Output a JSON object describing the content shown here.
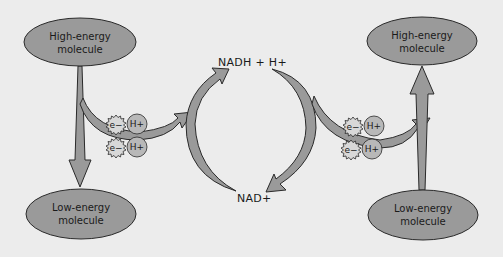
{
  "diagram": {
    "left": {
      "top_molecule": {
        "line1": "High-energy",
        "line2": "molecule"
      },
      "bottom_molecule": {
        "line1": "Low-energy",
        "line2": "molecule"
      },
      "particles": {
        "electron1": "e−",
        "proton1": "H+",
        "electron2": "e−",
        "proton2": "H+"
      }
    },
    "cycle": {
      "top_label": "NADH + H+",
      "bottom_label": "NAD+"
    },
    "right": {
      "top_molecule": {
        "line1": "High-energy",
        "line2": "molecule"
      },
      "bottom_molecule": {
        "line1": "Low-energy",
        "line2": "molecule"
      },
      "particles": {
        "electron1": "e−",
        "proton1": "H+",
        "electron2": "e−",
        "proton2": "H+"
      }
    },
    "colors": {
      "background": "#ececec",
      "fill": "#9a9a9a",
      "stroke": "#2a2a2a"
    }
  }
}
